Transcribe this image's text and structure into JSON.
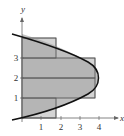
{
  "figure": {
    "type": "riemann-sum-region",
    "curve": "x = 4 - (y - 2)^2",
    "axes": {
      "x_label": "x",
      "y_label": "y"
    },
    "x_ticks": [
      "1",
      "2",
      "3",
      "4"
    ],
    "y_ticks": [
      "1",
      "2",
      "3"
    ],
    "rectangles": [
      {
        "y0": 0,
        "y1": 1,
        "width": 1.75
      },
      {
        "y0": 1,
        "y1": 2,
        "width": 3.75
      },
      {
        "y0": 2,
        "y1": 3,
        "width": 3.75
      },
      {
        "y0": 3,
        "y1": 4,
        "width": 1.75
      }
    ],
    "colors": {
      "rect_fill": "#c8c8c8",
      "region_fill": "#a9a9a9",
      "curve": "#111111",
      "axis": "#555555"
    }
  }
}
